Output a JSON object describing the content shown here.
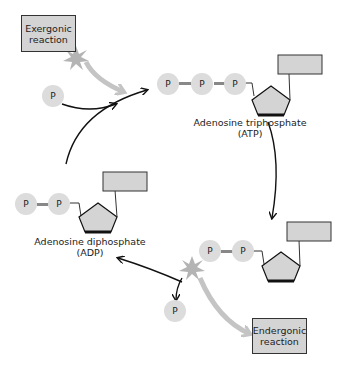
{
  "exergonic": {
    "line1": "Exergonic",
    "line2": "reaction"
  },
  "endergonic": {
    "line1": "Endergonic",
    "line2": "reaction"
  },
  "atp": {
    "name": "Adenosine triphosphate",
    "abbr": "(ATP)"
  },
  "adp": {
    "name": "Adenosine diphosphate",
    "abbr": "(ADP)"
  },
  "phosphate_label": "P",
  "colors": {
    "phosphate": "#dcdcdc",
    "box": "#d4d4d4",
    "arrow_gray": "#c4c4c4",
    "arrow_black": "#111111",
    "burst": "#b4b4b4"
  }
}
